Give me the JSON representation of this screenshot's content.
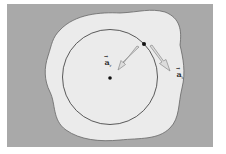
{
  "diagram": {
    "colors": {
      "background": "#a9a9a9",
      "blob_fill": "#ebebeb",
      "blob_stroke": "#666666",
      "circle_stroke": "#333333",
      "arrow_fill": "#dcdcdc",
      "arrow_stroke": "#8a8a8a",
      "point": "#111111"
    },
    "labels": {
      "radial": {
        "symbol": "a",
        "subscript": "r",
        "text": "a_r"
      },
      "tangential": {
        "symbol": "a",
        "subscript": "t",
        "text": "a_t"
      }
    },
    "points": [
      "particle-on-circle",
      "circle-center"
    ]
  }
}
